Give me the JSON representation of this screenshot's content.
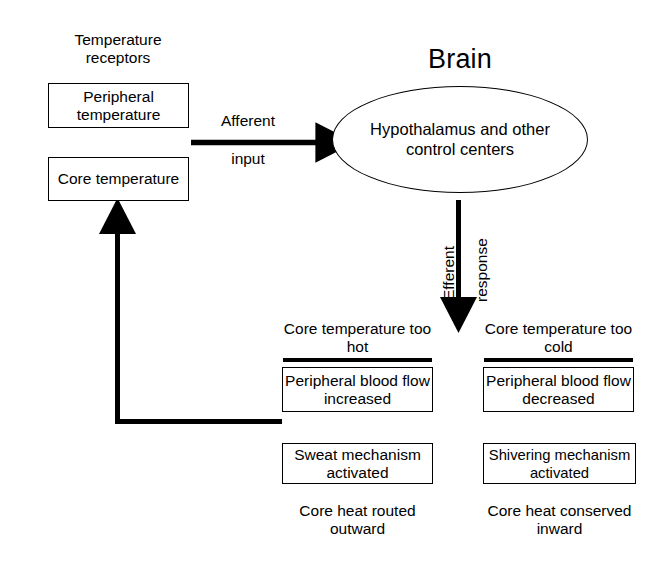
{
  "diagram": {
    "receptors": {
      "heading": "Temperature receptors",
      "boxes": [
        {
          "label": "Peripheral temperature"
        },
        {
          "label": "Core temperature"
        }
      ]
    },
    "afferent": {
      "label_top": "Afferent",
      "label_bottom": "input"
    },
    "brain": {
      "title": "Brain",
      "ellipse_label": "Hypothalamus and other control centers"
    },
    "efferent": {
      "label_left": "Efferent",
      "label_right": "response"
    },
    "branches": [
      {
        "heading": "Core temperature too hot",
        "box_primary": "Peripheral blood flow increased",
        "box_secondary": "Sweat mechanism activated",
        "outcome": "Core heat routed outward"
      },
      {
        "heading": "Core temperature too cold",
        "box_primary": "Peripheral blood flow decreased",
        "box_secondary": "Shivering mechanism activated",
        "outcome": "Core heat conserved inward"
      }
    ],
    "feedback": {
      "name": "feedback-loop-arrow"
    },
    "colors": {
      "ink": "#000000",
      "paper": "#ffffff"
    }
  }
}
